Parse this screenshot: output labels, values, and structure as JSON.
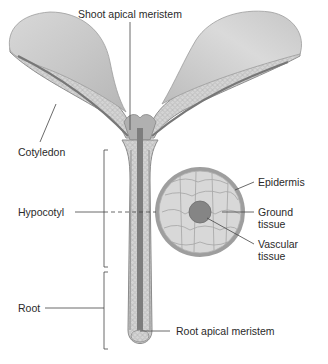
{
  "diagram": {
    "labels": {
      "shoot_apical_meristem": "Shoot apical meristem",
      "cotyledon": "Cotyledon",
      "hypocotyl": "Hypocotyl",
      "root": "Root",
      "root_apical_meristem": "Root apical meristem",
      "epidermis": "Epidermis",
      "ground_tissue_line1": "Ground",
      "ground_tissue_line2": "tissue",
      "vascular_tissue_line1": "Vascular",
      "vascular_tissue_line2": "tissue"
    },
    "colors": {
      "cotyledon_surface": "#c4c4c4",
      "cotyledon_highlight": "#e2e2e2",
      "ground_tissue": "#d2d2d2",
      "epidermis": "#9a9a9a",
      "vascular": "#7a7a7a",
      "leader_line": "#444444"
    }
  }
}
